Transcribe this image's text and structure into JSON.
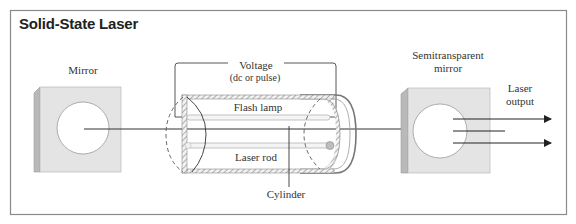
{
  "diagram": {
    "title": "Solid-State Laser",
    "labels": {
      "mirror": "Mirror",
      "voltage": "Voltage",
      "voltage_sub": "(dc or pulse)",
      "flash_lamp": "Flash lamp",
      "laser_rod": "Laser rod",
      "cylinder": "Cylinder",
      "semitransparent_line1": "Semitransparent",
      "semitransparent_line2": "mirror",
      "laser_output_line1": "Laser",
      "laser_output_line2": "output"
    },
    "colors": {
      "frame": "#8a8a8a",
      "mirror_face": "#e4e4e4",
      "mirror_side": "#b9b9b9",
      "line": "#333333",
      "hatch": "#9a9a9a"
    }
  }
}
